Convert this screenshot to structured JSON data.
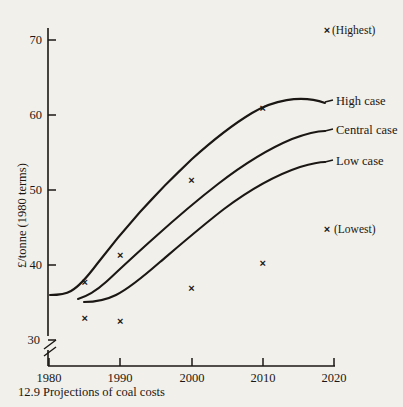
{
  "figure": {
    "caption": "12.9  Projections of coal costs",
    "background_color": "#f2f0ea",
    "ink_color": "#1a1714"
  },
  "chart_data": {
    "type": "line",
    "title": "",
    "subtitle": "",
    "xlabel": "",
    "ylabel": "£/tonne (1980 terms)",
    "xlim": [
      1980,
      2020
    ],
    "ylim": [
      28,
      73
    ],
    "y_axis_break": true,
    "y_axis_break_value": 30,
    "grid": false,
    "legend_position": "right-inline",
    "x_ticks": [
      1980,
      1990,
      2000,
      2010,
      2020
    ],
    "x_tick_labels": [
      "1980",
      "1990",
      "2000",
      "2010",
      "2020"
    ],
    "y_ticks": [
      30,
      40,
      50,
      60,
      70
    ],
    "y_tick_labels": [
      "30",
      "40",
      "50",
      "60",
      "70"
    ],
    "series": [
      {
        "name": "High case",
        "label": "High case",
        "x": [
          1980,
          1983,
          1985,
          1987,
          1990,
          1993,
          1996,
          2000,
          2004,
          2008,
          2012,
          2016,
          2020
        ],
        "values": [
          35.5,
          35.5,
          35.8,
          36.6,
          38.4,
          40.9,
          43.6,
          46.4,
          50.2,
          54.0,
          57.3,
          60.1,
          62.0
        ]
      },
      {
        "name": "Central case",
        "label": "Central case",
        "x": [
          1980,
          1983,
          1985,
          1987,
          1990,
          1993,
          1996,
          2000,
          2004,
          2008,
          2012,
          2016,
          2020
        ],
        "values": [
          35.5,
          35.5,
          35.5,
          36.0,
          37.4,
          39.3,
          41.6,
          44.0,
          47.2,
          50.3,
          53.2,
          55.7,
          57.5
        ]
      },
      {
        "name": "Low case",
        "label": "Low case",
        "x": [
          1985,
          1987,
          1989,
          1991,
          1994,
          1997,
          2000,
          2004,
          2008,
          2012,
          2016,
          2020
        ],
        "values": [
          34.4,
          34.4,
          34.8,
          35.7,
          37.4,
          39.4,
          41.2,
          43.8,
          46.4,
          48.8,
          51.0,
          52.5
        ]
      }
    ],
    "scatter_points": [
      {
        "group": "Highest",
        "x": 1985,
        "y": 37.7
      },
      {
        "group": "Highest",
        "x": 1990,
        "y": 41.3
      },
      {
        "group": "Highest",
        "x": 2000,
        "y": 51.3
      },
      {
        "group": "Highest",
        "x": 2010,
        "y": 61.0
      },
      {
        "group": "Lowest",
        "x": 1985,
        "y": 32.9
      },
      {
        "group": "Lowest",
        "x": 1990,
        "y": 32.6
      },
      {
        "group": "Lowest",
        "x": 2000,
        "y": 36.9
      },
      {
        "group": "Lowest",
        "x": 2010,
        "y": 40.3
      }
    ],
    "annotations": [
      {
        "name": "highest-key",
        "text": "(Highest)",
        "marker": "×"
      },
      {
        "name": "lowest-key",
        "text": "(Lowest)",
        "marker": "×"
      }
    ]
  },
  "labels": {
    "y_axis_title": "£/tonne (1980 terms)",
    "high_case": "High case",
    "central_case": "Central case",
    "low_case": "Low case",
    "highest_key": "(Highest)",
    "lowest_key": "(Lowest)",
    "marker_glyph": "×",
    "y_tick_30": "30",
    "y_tick_40": "40",
    "y_tick_50": "50",
    "y_tick_60": "60",
    "y_tick_70": "70",
    "x_tick_1980": "1980",
    "x_tick_1990": "1990",
    "x_tick_2000": "2000",
    "x_tick_2010": "2010",
    "x_tick_2020": "2020",
    "caption": "12.9  Projections of coal costs"
  }
}
